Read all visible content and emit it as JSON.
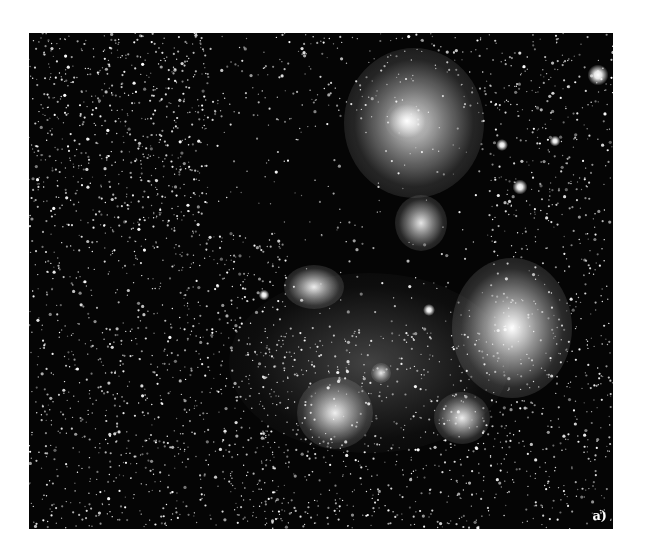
{
  "figure": {
    "panel_label": "a)",
    "colors": {
      "background": "#ffffff",
      "sky": "#050505",
      "star": "#ffffff"
    }
  },
  "stars": {
    "seed": 7,
    "dense_regions": [
      {
        "x": 0,
        "y": 0,
        "w": 180,
        "h": 200,
        "count": 700
      },
      {
        "x": 0,
        "y": 200,
        "w": 260,
        "h": 296,
        "count": 1000
      },
      {
        "x": 230,
        "y": 300,
        "w": 354,
        "h": 196,
        "count": 900
      },
      {
        "x": 460,
        "y": 0,
        "w": 124,
        "h": 300,
        "count": 450
      },
      {
        "x": 180,
        "y": 0,
        "w": 280,
        "h": 90,
        "count": 220
      },
      {
        "x": 180,
        "y": 90,
        "w": 280,
        "h": 210,
        "count": 160
      }
    ],
    "bright": [
      {
        "x": 569,
        "y": 42,
        "r": 3.5
      },
      {
        "x": 491,
        "y": 154,
        "r": 2.5
      },
      {
        "x": 473,
        "y": 112,
        "r": 2
      },
      {
        "x": 400,
        "y": 277,
        "r": 2
      },
      {
        "x": 235,
        "y": 262,
        "r": 1.8
      },
      {
        "x": 526,
        "y": 108,
        "r": 1.8
      }
    ]
  },
  "nebulae": [
    {
      "name": "upper-nebula",
      "x": 385,
      "y": 90,
      "rx": 70,
      "ry": 75,
      "intensity": 0.85
    },
    {
      "name": "upper-nebula-core",
      "x": 378,
      "y": 88,
      "rx": 22,
      "ry": 20,
      "intensity": 1.0
    },
    {
      "name": "mid-nebula-knot",
      "x": 392,
      "y": 190,
      "rx": 26,
      "ry": 28,
      "intensity": 0.9
    },
    {
      "name": "left-nebula",
      "x": 285,
      "y": 254,
      "rx": 30,
      "ry": 22,
      "intensity": 0.95
    },
    {
      "name": "right-bright-star-nebula",
      "x": 483,
      "y": 295,
      "rx": 60,
      "ry": 70,
      "intensity": 1.0
    },
    {
      "name": "lower-left-star-glow",
      "x": 306,
      "y": 380,
      "rx": 38,
      "ry": 36,
      "intensity": 0.95
    },
    {
      "name": "lower-right-star-glow",
      "x": 433,
      "y": 385,
      "rx": 28,
      "ry": 26,
      "intensity": 0.95
    },
    {
      "name": "small-glow",
      "x": 352,
      "y": 340,
      "rx": 10,
      "ry": 10,
      "intensity": 0.9
    },
    {
      "name": "diffuse-haze",
      "x": 340,
      "y": 330,
      "rx": 140,
      "ry": 90,
      "intensity": 0.25
    }
  ]
}
